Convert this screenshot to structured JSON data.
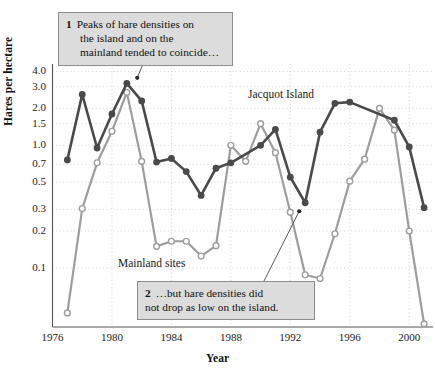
{
  "chart_data": {
    "type": "line",
    "title": "",
    "xlabel": "Year",
    "ylabel": "Hares per hectare",
    "yscale": "log",
    "ylim": [
      0.033,
      4.6
    ],
    "xlim": [
      1976,
      2001.6
    ],
    "grid": "dotted",
    "legend_position": "inline-annotations",
    "ytick_labels": [
      "4.0",
      "3.0",
      "2.0",
      "1.5",
      "1.0",
      "0.7",
      "0.5",
      "0.3",
      "0.2",
      "0.1"
    ],
    "ytick_values": [
      4.0,
      3.0,
      2.0,
      1.5,
      1.0,
      0.7,
      0.5,
      0.3,
      0.2,
      0.1
    ],
    "xtick_labels": [
      "1976",
      "1980",
      "1984",
      "1988",
      "1992",
      "1996",
      "2000"
    ],
    "xtick_values": [
      1976,
      1980,
      1984,
      1988,
      1992,
      1996,
      2000
    ],
    "series": [
      {
        "name": "Jacquot Island",
        "color": "#4a4a4a",
        "marker": "filled-circle",
        "x": [
          1977,
          1978,
          1979,
          1980,
          1981,
          1982,
          1983,
          1984,
          1985,
          1986,
          1987,
          1988,
          1990,
          1991,
          1992,
          1993,
          1994,
          1995,
          1996,
          1999,
          2000,
          2001
        ],
        "values": [
          0.76,
          2.6,
          0.95,
          1.8,
          3.2,
          2.3,
          0.73,
          0.78,
          0.61,
          0.39,
          0.65,
          0.72,
          1.0,
          1.35,
          0.55,
          0.34,
          1.28,
          2.2,
          2.25,
          1.6,
          0.97,
          0.31
        ]
      },
      {
        "name": "Mainland sites",
        "color": "#9d9d9d",
        "marker": "open-circle",
        "x": [
          1977,
          1978,
          1979,
          1980,
          1981,
          1982,
          1983,
          1984,
          1985,
          1986,
          1987,
          1988,
          1989,
          1990,
          1991,
          1992,
          1993,
          1994,
          1995,
          1996,
          1997,
          1998,
          1999,
          2000,
          2001
        ],
        "values": [
          0.043,
          0.305,
          0.72,
          1.3,
          2.7,
          0.74,
          0.15,
          0.165,
          0.165,
          0.125,
          0.152,
          1.0,
          0.74,
          1.5,
          0.87,
          0.285,
          0.088,
          0.082,
          0.19,
          0.51,
          0.77,
          2.0,
          1.33,
          0.2,
          0.035
        ]
      }
    ],
    "annotations": [
      {
        "id": 1,
        "number": "1",
        "lines": [
          "Peaks of hare densities on",
          "the island and on the",
          "mainland tended to coincide…"
        ],
        "points_to_x": 1981.7,
        "points_to_y": 3.55
      },
      {
        "id": 2,
        "number": "2",
        "lines": [
          "…but hare densities did",
          "not drop as low on the island."
        ],
        "points_to_x": 1992.6,
        "points_to_y": 0.29
      }
    ],
    "series_labels": [
      {
        "text": "Jacquot Island",
        "x": 248,
        "y": 88
      },
      {
        "text": "Mainland sites",
        "x": 118,
        "y": 257
      }
    ]
  },
  "colors": {
    "island_line": "#4a4a4a",
    "mainland_line": "#9d9d9d",
    "axis": "#555555",
    "grid": "#c9c9c9",
    "callout_bg": "#dcdcdc",
    "callout_border": "#8d8d8d",
    "text": "#1a1a1a"
  }
}
